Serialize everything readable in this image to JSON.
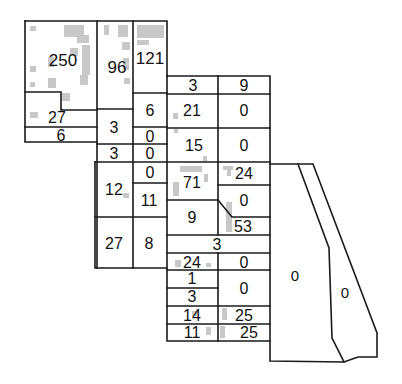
{
  "map": {
    "line_color": "#1a1a1a",
    "building_color": "#c8c8c8",
    "parcels": [
      {
        "id": "p250",
        "label": "250",
        "x": 63,
        "y": 60,
        "size": 17
      },
      {
        "id": "p96",
        "label": "96",
        "x": 117,
        "y": 67,
        "size": 17
      },
      {
        "id": "p121",
        "label": "121",
        "x": 150,
        "y": 58,
        "size": 17
      },
      {
        "id": "p27a",
        "label": "27",
        "x": 57,
        "y": 117,
        "size": 16
      },
      {
        "id": "p6a",
        "label": "6",
        "x": 61,
        "y": 135,
        "size": 16
      },
      {
        "id": "p3a",
        "label": "3",
        "x": 114,
        "y": 127,
        "size": 16
      },
      {
        "id": "p6b",
        "label": "6",
        "x": 150,
        "y": 110,
        "size": 16
      },
      {
        "id": "p0a",
        "label": "0",
        "x": 150,
        "y": 136,
        "size": 16
      },
      {
        "id": "p3b",
        "label": "3",
        "x": 114,
        "y": 153,
        "size": 16
      },
      {
        "id": "p0b",
        "label": "0",
        "x": 150,
        "y": 153,
        "size": 16
      },
      {
        "id": "p3c",
        "label": "3",
        "x": 193,
        "y": 85,
        "size": 16
      },
      {
        "id": "p9a",
        "label": "9",
        "x": 244,
        "y": 85,
        "size": 16
      },
      {
        "id": "p21",
        "label": "21",
        "x": 192,
        "y": 110,
        "size": 16
      },
      {
        "id": "p0c",
        "label": "0",
        "x": 244,
        "y": 110,
        "size": 16
      },
      {
        "id": "p15",
        "label": "15",
        "x": 194,
        "y": 145,
        "size": 16
      },
      {
        "id": "p0d",
        "label": "0",
        "x": 244,
        "y": 145,
        "size": 16
      },
      {
        "id": "p12",
        "label": "12",
        "x": 114,
        "y": 189,
        "size": 16
      },
      {
        "id": "p0e",
        "label": "0",
        "x": 150,
        "y": 172,
        "size": 16
      },
      {
        "id": "p11",
        "label": "11",
        "x": 149,
        "y": 200,
        "size": 16
      },
      {
        "id": "p71",
        "label": "71",
        "x": 192,
        "y": 182,
        "size": 16
      },
      {
        "id": "p24a",
        "label": "24",
        "x": 244,
        "y": 173,
        "size": 16
      },
      {
        "id": "p0f",
        "label": "0",
        "x": 244,
        "y": 200,
        "size": 16
      },
      {
        "id": "p9b",
        "label": "9",
        "x": 192,
        "y": 217,
        "size": 16
      },
      {
        "id": "p53",
        "label": "53",
        "x": 243,
        "y": 226,
        "size": 16
      },
      {
        "id": "p27b",
        "label": "27",
        "x": 114,
        "y": 243,
        "size": 16
      },
      {
        "id": "p8",
        "label": "8",
        "x": 149,
        "y": 243,
        "size": 16
      },
      {
        "id": "p3d",
        "label": "3",
        "x": 217,
        "y": 244,
        "size": 16
      },
      {
        "id": "p24b",
        "label": "24",
        "x": 192,
        "y": 262,
        "size": 16
      },
      {
        "id": "p0g",
        "label": "0",
        "x": 244,
        "y": 262,
        "size": 16
      },
      {
        "id": "p1",
        "label": "1",
        "x": 192,
        "y": 278,
        "size": 16
      },
      {
        "id": "p3e",
        "label": "3",
        "x": 192,
        "y": 296,
        "size": 16
      },
      {
        "id": "p0h",
        "label": "0",
        "x": 244,
        "y": 288,
        "size": 16
      },
      {
        "id": "p14",
        "label": "14",
        "x": 192,
        "y": 315,
        "size": 16
      },
      {
        "id": "p25a",
        "label": "25",
        "x": 244,
        "y": 315,
        "size": 16
      },
      {
        "id": "p11b",
        "label": "11",
        "x": 192,
        "y": 332,
        "size": 16
      },
      {
        "id": "p25b",
        "label": "25",
        "x": 249,
        "y": 332,
        "size": 16
      },
      {
        "id": "p0i",
        "label": "0",
        "x": 295,
        "y": 275,
        "size": 15
      },
      {
        "id": "p0j",
        "label": "0",
        "x": 345,
        "y": 292,
        "size": 15
      }
    ]
  }
}
